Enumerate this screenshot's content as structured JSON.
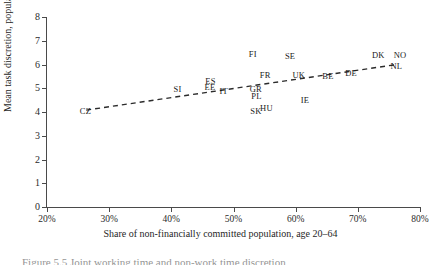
{
  "figure": {
    "caption_partial": "Figure 5.5 Joint working time and non-work time discretion"
  },
  "chart_data": {
    "type": "scatter",
    "title": "",
    "xlabel": "Share of non-financially committed population, age 20–64",
    "ylabel": "Mean task discretion, population age 20–64",
    "xlim": [
      20,
      80
    ],
    "ylim": [
      0,
      8
    ],
    "xticks": [
      20,
      30,
      40,
      50,
      60,
      70,
      80
    ],
    "xticklabels": [
      "20%",
      "30%",
      "40%",
      "50%",
      "60%",
      "70%",
      "80%"
    ],
    "yticks": [
      0,
      1,
      2,
      3,
      4,
      5,
      6,
      7,
      8
    ],
    "yticklabels": [
      "0",
      "1",
      "2",
      "3",
      "4",
      "5",
      "6",
      "7",
      "8"
    ],
    "grid": false,
    "legend": false,
    "marker_style": "text-label",
    "points": [
      {
        "label": "CZ",
        "x": 26.2,
        "y": 4.05
      },
      {
        "label": "SI",
        "x": 41.0,
        "y": 4.95
      },
      {
        "label": "ES",
        "x": 46.3,
        "y": 5.3
      },
      {
        "label": "EE",
        "x": 46.2,
        "y": 5.05
      },
      {
        "label": "IT",
        "x": 48.4,
        "y": 4.9
      },
      {
        "label": "FI",
        "x": 53.1,
        "y": 6.45
      },
      {
        "label": "FR",
        "x": 55.1,
        "y": 5.55
      },
      {
        "label": "GR",
        "x": 53.6,
        "y": 4.98
      },
      {
        "label": "PL",
        "x": 53.7,
        "y": 4.68
      },
      {
        "label": "SK",
        "x": 53.6,
        "y": 4.05
      },
      {
        "label": "HU",
        "x": 55.3,
        "y": 4.18
      },
      {
        "label": "SE",
        "x": 59.1,
        "y": 6.38
      },
      {
        "label": "UK",
        "x": 60.5,
        "y": 5.55
      },
      {
        "label": "IE",
        "x": 61.5,
        "y": 4.5
      },
      {
        "label": "BE",
        "x": 65.2,
        "y": 5.52
      },
      {
        "label": "DE",
        "x": 68.9,
        "y": 5.65
      },
      {
        "label": "DK",
        "x": 73.3,
        "y": 6.42
      },
      {
        "label": "NO",
        "x": 76.8,
        "y": 6.42
      },
      {
        "label": "NL",
        "x": 76.2,
        "y": 5.95
      }
    ],
    "trendline": {
      "style": "dashed",
      "color": "#2b2b2b",
      "x_start": 26.3,
      "y_start": 4.08,
      "x_end": 76.3,
      "y_end": 6.0
    }
  }
}
